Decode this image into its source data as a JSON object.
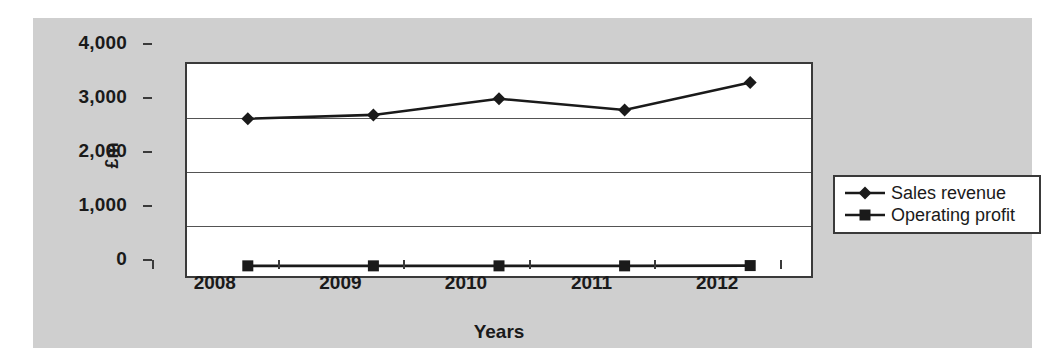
{
  "chart_data": {
    "type": "line",
    "title": "",
    "xlabel": "Years",
    "ylabel": "£m",
    "categories": [
      "2008",
      "2009",
      "2010",
      "2011",
      "2012"
    ],
    "ylim": [
      0,
      4000
    ],
    "yticks": [
      0,
      1000,
      2000,
      3000,
      4000
    ],
    "ytick_labels": [
      "0",
      "1,000",
      "2,000",
      "3,000",
      "4,000"
    ],
    "grid": true,
    "legend_position": "right",
    "series": [
      {
        "name": "Sales revenue",
        "marker": "diamond",
        "color": "#1a1a1a",
        "values": [
          2950,
          3020,
          3320,
          3110,
          3620
        ]
      },
      {
        "name": "Operating profit",
        "marker": "square",
        "color": "#1a1a1a",
        "values": [
          225,
          225,
          225,
          225,
          230
        ]
      }
    ]
  },
  "figure": {
    "background_color": "#cfcfcf",
    "plot_background_color": "#ffffff",
    "axis_color": "#3a3a3a"
  }
}
